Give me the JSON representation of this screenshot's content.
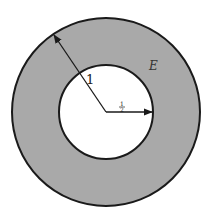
{
  "diagram": {
    "type": "annulus",
    "colors": {
      "region_fill": "#a9a9a9",
      "inner_fill": "#ffffff",
      "stroke": "#1a1a1a"
    },
    "outer_circle": {
      "cx": 106,
      "cy": 112,
      "r": 94
    },
    "inner_circle": {
      "cx": 106,
      "cy": 112,
      "r": 47
    },
    "labels": {
      "outer_radius": "1",
      "inner_radius_num": "1",
      "inner_radius_den": "2",
      "region": "E"
    }
  }
}
